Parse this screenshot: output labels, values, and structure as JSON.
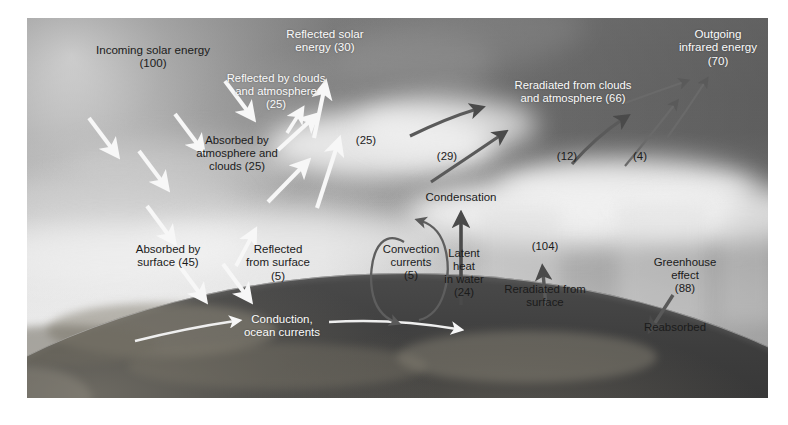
{
  "diagram": {
    "colors": {
      "white_arrow": "#f7f7f7",
      "dark_arrow": "#4a4a4a",
      "light_label": "#fbfbfb",
      "dark_label": "#1b1b1b",
      "page_background": "#ffffff"
    },
    "labels": [
      {
        "id": "incoming-solar-energy",
        "text": "Incoming solar energy\n(100)",
        "tone": "dark"
      },
      {
        "id": "reflected-by-clouds",
        "text": "Reflected by clouds\nand atmosphere\n(25)",
        "tone": "light"
      },
      {
        "id": "reflected-solar-energy",
        "text": "Reflected solar\nenergy (30)",
        "tone": "light"
      },
      {
        "id": "absorbed-by-atmosphere",
        "text": "Absorbed by\natmosphere and\nclouds (25)",
        "tone": "dark"
      },
      {
        "id": "value-25-reflected",
        "text": "(25)",
        "tone": "dark"
      },
      {
        "id": "reradiated-from-clouds",
        "text": "Reradiated from clouds\nand atmosphere (66)",
        "tone": "light"
      },
      {
        "id": "outgoing-infrared-energy",
        "text": "Outgoing\ninfrared energy\n(70)",
        "tone": "light"
      },
      {
        "id": "value-29",
        "text": "(29)",
        "tone": "dark"
      },
      {
        "id": "value-12",
        "text": "(12)",
        "tone": "dark"
      },
      {
        "id": "value-4",
        "text": "(4)",
        "tone": "dark"
      },
      {
        "id": "condensation",
        "text": "Condensation",
        "tone": "dark"
      },
      {
        "id": "absorbed-by-surface",
        "text": "Absorbed by\nsurface (45)",
        "tone": "dark"
      },
      {
        "id": "reflected-from-surface",
        "text": "Reflected\nfrom surface\n(5)",
        "tone": "dark"
      },
      {
        "id": "convection-currents",
        "text": "Convection\ncurrents\n(5)",
        "tone": "dark"
      },
      {
        "id": "latent-heat-in-water",
        "text": "Latent\nheat\nin water\n(24)",
        "tone": "dark"
      },
      {
        "id": "value-104",
        "text": "(104)",
        "tone": "dark"
      },
      {
        "id": "reradiated-from-surface",
        "text": "Reradiated from\nsurface",
        "tone": "dark"
      },
      {
        "id": "greenhouse-effect",
        "text": "Greenhouse\neffect\n(88)",
        "tone": "dark"
      },
      {
        "id": "reabsorbed",
        "text": "Reabsorbed",
        "tone": "dark"
      },
      {
        "id": "conduction-ocean-currents",
        "text": "Conduction,\nocean currents",
        "tone": "light"
      }
    ],
    "flows": [
      {
        "name": "incoming-solar-energy",
        "value": 100,
        "direction": "down",
        "color": "white"
      },
      {
        "name": "reflected-by-clouds-and-atmosphere",
        "value": 25,
        "direction": "up",
        "color": "white"
      },
      {
        "name": "reflected-solar-energy",
        "value": 30,
        "direction": "up",
        "color": "white"
      },
      {
        "name": "absorbed-by-atmosphere-and-clouds",
        "value": 25,
        "direction": "down",
        "color": "white"
      },
      {
        "name": "reflected-from-surface",
        "value": 5,
        "direction": "up",
        "color": "white"
      },
      {
        "name": "absorbed-by-surface",
        "value": 45,
        "direction": "down",
        "color": "white"
      },
      {
        "name": "convection-currents",
        "value": 5,
        "direction": "loop",
        "color": "dark"
      },
      {
        "name": "latent-heat-in-water",
        "value": 24,
        "direction": "up",
        "color": "dark"
      },
      {
        "name": "reradiated-from-surface",
        "value": 104,
        "direction": "up",
        "color": "dark"
      },
      {
        "name": "greenhouse-effect-reabsorbed",
        "value": 88,
        "direction": "down",
        "color": "dark"
      },
      {
        "name": "reradiated-from-clouds-and-atmosphere",
        "value": 66,
        "direction": "up",
        "color": "dark"
      },
      {
        "name": "outgoing-infrared-energy",
        "value": 70,
        "direction": "up",
        "color": "dark"
      },
      {
        "name": "conduction-ocean-currents",
        "value": null,
        "direction": "right",
        "color": "white"
      }
    ]
  }
}
